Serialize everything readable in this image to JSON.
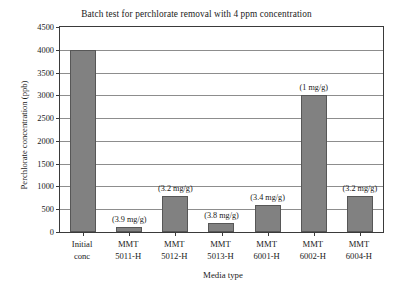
{
  "chart_data": {
    "type": "bar",
    "title": "Batch test for perchlorate removal with 4 ppm concentration",
    "xlabel": "Media type",
    "ylabel": "Perchlorate concentration (ppb)",
    "categories": [
      "Initial conc",
      "MMT 5011-H",
      "MMT 5012-H",
      "MMT 5013-H",
      "MMT 6001-H",
      "MMT 6002-H",
      "MMT 6004-H"
    ],
    "category_lines": [
      [
        "Initial",
        "conc"
      ],
      [
        "MMT",
        "5011-H"
      ],
      [
        "MMT",
        "5012-H"
      ],
      [
        "MMT",
        "5013-H"
      ],
      [
        "MMT",
        "6001-H"
      ],
      [
        "MMT",
        "6002-H"
      ],
      [
        "MMT",
        "6004-H"
      ]
    ],
    "values": [
      4000,
      100,
      800,
      200,
      600,
      3000,
      800
    ],
    "annotations": [
      "",
      "(3.9 mg/g)",
      "(3.2 mg/g)",
      "(3.8 mg/g)",
      "(3.4 mg/g)",
      "(1 mg/g)",
      "(3.2 mg/g)"
    ],
    "ylim": [
      0,
      4500
    ],
    "ytick_values": [
      0,
      500,
      1000,
      1500,
      2000,
      2500,
      3000,
      3500,
      4000,
      4500
    ],
    "ytick_labels": [
      "0",
      "500",
      "1000",
      "1500",
      "2000",
      "2500",
      "3000",
      "3500",
      "4000",
      "4500"
    ],
    "grid": true,
    "legend": "none",
    "bar_color": "#818181",
    "bar_edge_color": "#575757",
    "grid_color": "#8d8d8d",
    "axis_color": "#3a3a3a",
    "background_color": "#ffffff"
  }
}
